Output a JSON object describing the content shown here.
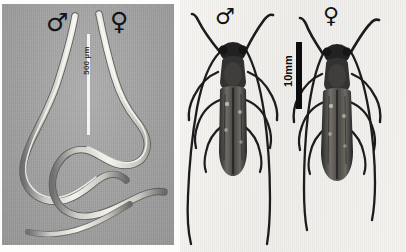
{
  "figure": {
    "background_color": "#fdfdfb",
    "panels": [
      {
        "id": "left",
        "subject": "nematodes",
        "image_type": "phase-contrast micrograph",
        "background_color": "#a3a3a3",
        "specimen_color": "#efeee9",
        "labels": {
          "male_symbol": "♂",
          "female_symbol": "♀"
        },
        "scale_bar": {
          "text": "500 µm",
          "color": "#f4f4f2",
          "orientation": "vertical"
        }
      },
      {
        "id": "right",
        "subject": "longhorn beetles",
        "image_type": "grayscale photograph",
        "background_color": "#f2f1ee",
        "specimen_color": "#1a1a1a",
        "labels": {
          "male_symbol": "♂",
          "female_symbol": "♀"
        },
        "scale_bar": {
          "text": "10mm",
          "color": "#0d0d0d",
          "orientation": "vertical"
        }
      }
    ]
  }
}
